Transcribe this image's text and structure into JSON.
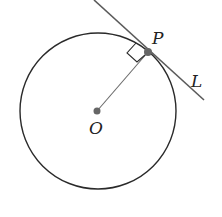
{
  "diagram": {
    "type": "geometry",
    "colors": {
      "stroke": "#2a2a2a",
      "line": "#5a5a5a",
      "point": "#666666",
      "background": "#ffffff"
    },
    "circle": {
      "cx": 98,
      "cy": 111,
      "r": 78
    },
    "points": [
      {
        "id": "O",
        "label": "O",
        "x": 97,
        "y": 111,
        "label_x": 89,
        "label_y": 134
      },
      {
        "id": "P",
        "label": "P",
        "x": 148,
        "y": 52,
        "label_x": 152,
        "label_y": 44
      }
    ],
    "segments": [
      {
        "id": "radius-OP",
        "from": "O",
        "to": "P"
      }
    ],
    "lines": [
      {
        "id": "L",
        "label": "L",
        "x1": 94,
        "y1": 0,
        "x2": 204,
        "y2": 100,
        "label_x": 191,
        "label_y": 87
      }
    ],
    "right_angle_marker": {
      "at": "P",
      "size": 11
    }
  }
}
